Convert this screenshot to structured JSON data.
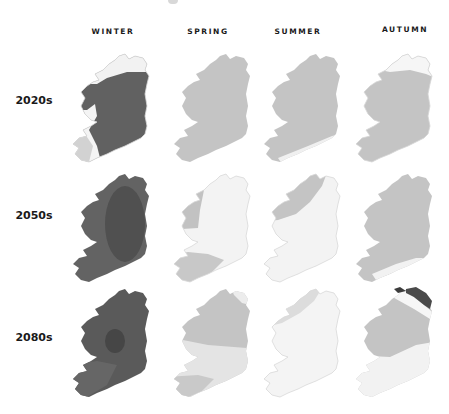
{
  "columns": [
    {
      "label": "WINTER"
    },
    {
      "label": "SPRING"
    },
    {
      "label": "SUMMER"
    },
    {
      "label": "AUTUMN"
    }
  ],
  "rows": [
    {
      "label": "2020s"
    },
    {
      "label": "2050s"
    },
    {
      "label": "2080s"
    }
  ],
  "shading": {
    "very_dark": "#4a4a4a",
    "dark": "#616161",
    "medium": "#c3c3c3",
    "light": "#e4e4e4",
    "white": "#f7f7f7"
  },
  "cells": [
    {
      "row": "2020s",
      "season": "WINTER",
      "base": "dark",
      "features": [
        "white north cap",
        "white south-west tip"
      ]
    },
    {
      "row": "2020s",
      "season": "SPRING",
      "base": "medium",
      "features": []
    },
    {
      "row": "2020s",
      "season": "SUMMER",
      "base": "medium",
      "features": [
        "white south coast strip"
      ]
    },
    {
      "row": "2020s",
      "season": "AUTUMN",
      "base": "medium",
      "features": [
        "white north cap"
      ]
    },
    {
      "row": "2050s",
      "season": "WINTER",
      "base": "dark",
      "features": [
        "very dark central-east core"
      ]
    },
    {
      "row": "2050s",
      "season": "SPRING",
      "base": "white",
      "features": [
        "medium west",
        "medium south-west"
      ]
    },
    {
      "row": "2050s",
      "season": "SUMMER",
      "base": "white",
      "features": [
        "medium north-west"
      ]
    },
    {
      "row": "2050s",
      "season": "AUTUMN",
      "base": "medium",
      "features": [
        "white south coast strip"
      ]
    },
    {
      "row": "2080s",
      "season": "WINTER",
      "base": "dark",
      "features": [
        "very dark central spot"
      ]
    },
    {
      "row": "2080s",
      "season": "SPRING",
      "base": "medium",
      "features": [
        "light south band",
        "medium south-west tip"
      ]
    },
    {
      "row": "2080s",
      "season": "SUMMER",
      "base": "white",
      "features": [
        "light north-west"
      ]
    },
    {
      "row": "2080s",
      "season": "AUTUMN",
      "base": "medium",
      "features": [
        "very dark north-east",
        "white north band",
        "white south-east"
      ]
    }
  ]
}
